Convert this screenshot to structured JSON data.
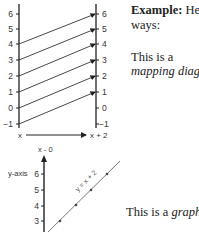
{
  "mapping_diagram": {
    "left_axis_label": "x",
    "right_axis_label": "x + 2",
    "left_ticks": [
      "6",
      "5",
      "4",
      "3",
      "2",
      "1",
      "0",
      "−1"
    ],
    "right_ticks": [
      "6",
      "5",
      "4",
      "3",
      "2",
      "1",
      "0",
      "−1"
    ],
    "mappings": [
      {
        "from": "4",
        "to": "6"
      },
      {
        "from": "3",
        "to": "5"
      },
      {
        "from": "2",
        "to": "4"
      },
      {
        "from": "1",
        "to": "3"
      },
      {
        "from": "0",
        "to": "2"
      },
      {
        "from": "−1",
        "to": "1"
      }
    ]
  },
  "graph": {
    "top_label": "x - 0",
    "y_axis_label": "y-axis",
    "ticks": [
      "6",
      "5",
      "4",
      "3"
    ],
    "line_label": "y = x + 2"
  },
  "text": {
    "example_bold": "Example:",
    "example_rest": " He",
    "ways": "ways:",
    "this_is_a": "This is a",
    "mapping_diagram": "mapping diagr",
    "graph_prefix": "This is a ",
    "graph_word": "graph",
    "graph_suffix": "."
  },
  "colors": {
    "ink": "#222222",
    "line_gray": "#777777"
  }
}
